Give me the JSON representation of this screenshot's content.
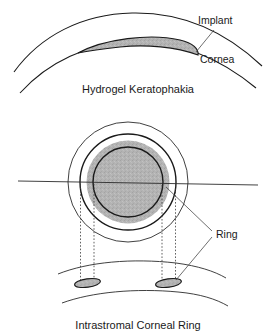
{
  "figure": {
    "background_color": "#ffffff",
    "line_color": "#1a1a1a",
    "implant_fill_color": "#b3b3b3"
  },
  "panels": [
    {
      "id": "top",
      "caption": "Hydrogel Keratophakia",
      "description": "Cross-section of cornea with a lenticular hydrogel implant inserted within the stroma",
      "labels": [
        {
          "text": "Implant",
          "target": "gray-lenticule"
        },
        {
          "text": "Cornea",
          "target": "corneal-curve"
        }
      ]
    },
    {
      "id": "bottom",
      "caption": "Intrastromal Corneal Ring",
      "description": "Frontal view of an annular ring in the cornea with projection lines to a cross-section showing two ring segment profiles",
      "labels": [
        {
          "text": "Ring",
          "target": "ring-annulus"
        }
      ]
    }
  ],
  "top_panel": {
    "caption": "Hydrogel Keratophakia",
    "implant_label": "Implant",
    "cornea_label": "Cornea"
  },
  "bottom_panel": {
    "caption": "Intrastromal Corneal Ring",
    "ring_label": "Ring"
  }
}
